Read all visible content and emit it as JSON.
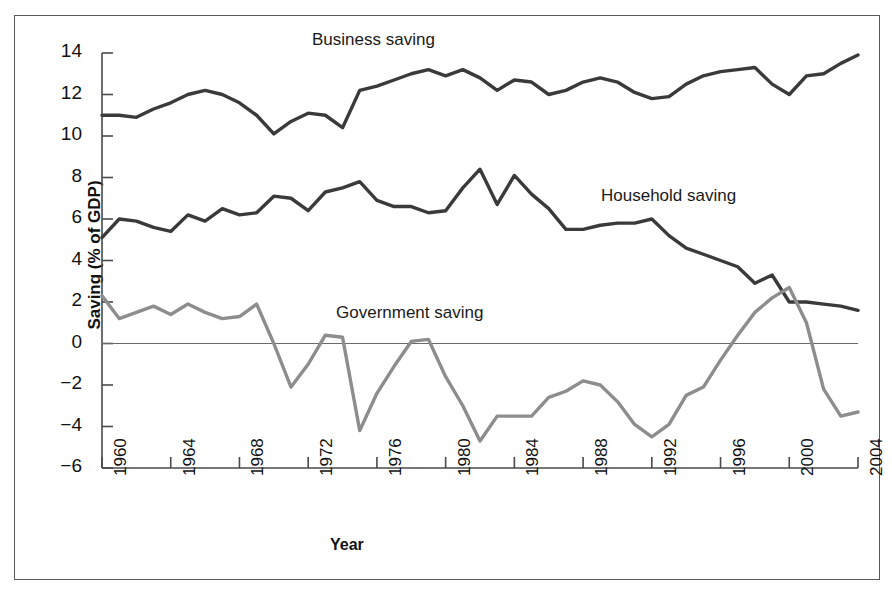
{
  "figure": {
    "title": "",
    "x_axis_title": "Year",
    "y_axis_title": "Saving (% of GDP)"
  },
  "annotations": {
    "business": "Business saving",
    "household": "Household saving",
    "government": "Government saving"
  },
  "colors": {
    "business_line": "#3a3a3a",
    "household_line": "#3a3a3a",
    "government_line": "#8d8d8d",
    "axis": "#4a4a4a",
    "frame": "#5a5a5a",
    "text": "#111111",
    "background": "#ffffff"
  },
  "chart_data": {
    "type": "line",
    "title": "",
    "xlabel": "Year",
    "ylabel": "Saving (% of GDP)",
    "xlim": [
      1960,
      2004
    ],
    "ylim": [
      -6,
      14
    ],
    "yticks": [
      -6,
      -4,
      -2,
      0,
      2,
      4,
      6,
      8,
      10,
      12,
      14
    ],
    "ytick_labels": [
      "−6",
      "−4",
      "−2",
      "0",
      "2",
      "4",
      "6",
      "8",
      "10",
      "12",
      "14"
    ],
    "xticks": [
      1960,
      1964,
      1968,
      1972,
      1976,
      1980,
      1984,
      1988,
      1992,
      1996,
      2000,
      2004
    ],
    "xtick_labels": [
      "1960",
      "1964",
      "1968",
      "1972",
      "1976",
      "1980",
      "1984",
      "1988",
      "1992",
      "1996",
      "2000",
      "2004"
    ],
    "grid": false,
    "legend_position": "inline-annotations",
    "zero_line": true,
    "x": [
      1960,
      1961,
      1962,
      1963,
      1964,
      1965,
      1966,
      1967,
      1968,
      1969,
      1970,
      1971,
      1972,
      1973,
      1974,
      1975,
      1976,
      1977,
      1978,
      1979,
      1980,
      1981,
      1982,
      1983,
      1984,
      1985,
      1986,
      1987,
      1988,
      1989,
      1990,
      1991,
      1992,
      1993,
      1994,
      1995,
      1996,
      1997,
      1998,
      1999,
      2000,
      2001,
      2002,
      2003,
      2004
    ],
    "series": [
      {
        "name": "Business saving",
        "color": "#3a3a3a",
        "values": [
          11.0,
          11.0,
          10.9,
          11.3,
          11.6,
          12.0,
          12.2,
          12.0,
          11.6,
          11.0,
          10.1,
          10.7,
          11.1,
          11.0,
          10.4,
          12.2,
          12.4,
          12.7,
          13.0,
          13.2,
          12.9,
          13.2,
          12.8,
          12.2,
          12.7,
          12.6,
          12.0,
          12.2,
          12.6,
          12.8,
          12.6,
          12.1,
          11.8,
          11.9,
          12.5,
          12.9,
          13.1,
          13.2,
          13.3,
          12.5,
          12.0,
          12.9,
          13.0,
          13.5,
          13.9
        ]
      },
      {
        "name": "Household saving",
        "color": "#3a3a3a",
        "values": [
          5.1,
          6.0,
          5.9,
          5.6,
          5.4,
          6.2,
          5.9,
          6.5,
          6.2,
          6.3,
          7.1,
          7.0,
          6.4,
          7.3,
          7.5,
          7.8,
          6.9,
          6.6,
          6.6,
          6.3,
          6.4,
          7.5,
          8.4,
          6.7,
          8.1,
          7.2,
          6.5,
          5.5,
          5.5,
          5.7,
          5.8,
          5.8,
          6.0,
          5.2,
          4.6,
          4.3,
          4.0,
          3.7,
          2.9,
          3.3,
          2.0,
          2.0,
          1.9,
          1.8,
          1.6
        ]
      },
      {
        "name": "Government saving",
        "color": "#8d8d8d",
        "values": [
          2.3,
          1.2,
          1.5,
          1.8,
          1.4,
          1.9,
          1.5,
          1.2,
          1.3,
          1.9,
          0.0,
          -2.1,
          -1.0,
          0.4,
          0.3,
          -4.2,
          -2.4,
          -1.1,
          0.1,
          0.2,
          -1.6,
          -3.0,
          -4.7,
          -3.5,
          -3.5,
          -3.5,
          -2.6,
          -2.3,
          -1.8,
          -2.0,
          -2.8,
          -3.9,
          -4.5,
          -3.9,
          -2.5,
          -2.1,
          -0.8,
          0.4,
          1.5,
          2.2,
          2.7,
          1.0,
          -2.2,
          -3.5,
          -3.3
        ]
      }
    ]
  }
}
